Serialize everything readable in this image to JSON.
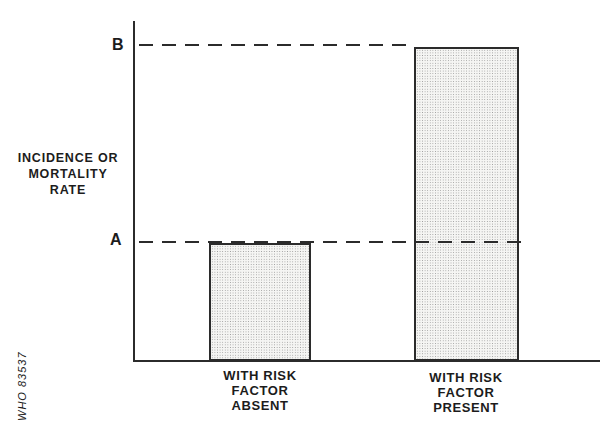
{
  "colors": {
    "line": "#2b2b2b",
    "text": "#1c1c1c",
    "bar-fill-bg": "#f5f5f3",
    "bar-dot": "#9a9a9a",
    "background": "#ffffff"
  },
  "figure": {
    "credit": "WHO 83537",
    "y_axis": {
      "label_lines": [
        "INCIDENCE OR",
        "MORTALITY",
        "RATE"
      ]
    },
    "reference_levels": {
      "top": "B",
      "bottom": "A"
    },
    "bars": [
      {
        "level": "A",
        "label_lines": [
          "WITH RISK",
          "FACTOR",
          "ABSENT"
        ]
      },
      {
        "level": "B",
        "label_lines": [
          "WITH RISK",
          "FACTOR",
          "PRESENT"
        ]
      }
    ]
  },
  "chart_data": {
    "type": "bar",
    "title": "",
    "xlabel": "",
    "ylabel": "INCIDENCE OR MORTALITY RATE",
    "categories": [
      "WITH RISK FACTOR ABSENT",
      "WITH RISK FACTOR PRESENT"
    ],
    "values": [
      "A",
      "B"
    ],
    "values_relative_to_axis_height": [
      0.35,
      0.93
    ],
    "reference_lines": [
      {
        "label": "A",
        "style": "dashed",
        "at_bar": "WITH RISK FACTOR ABSENT",
        "relative_value": 0.35
      },
      {
        "label": "B",
        "style": "dashed",
        "at_bar": "WITH RISK FACTOR PRESENT",
        "relative_value": 0.93
      }
    ],
    "bar_fill": "stippled-dot-pattern",
    "grid": false,
    "legend": false,
    "axis_numeric_scale": false,
    "annotation": "WHO 83537"
  }
}
